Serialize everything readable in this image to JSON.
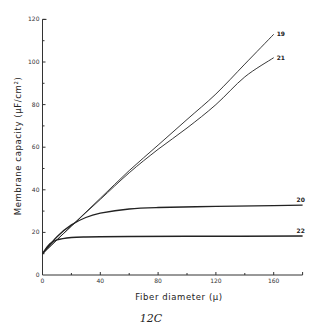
{
  "chart_data": {
    "type": "line",
    "title": "",
    "caption": "12C",
    "xlabel": "Fiber diameter (μ)",
    "ylabel": "Membrane capacity (μF/cm²)",
    "xlim": [
      0,
      180
    ],
    "ylim": [
      0,
      120
    ],
    "x_ticks": [
      0,
      40,
      80,
      120,
      160
    ],
    "x_minor_ticks": [
      20,
      60,
      100,
      140
    ],
    "y_ticks": [
      0,
      20,
      40,
      60,
      80,
      100,
      120
    ],
    "y_minor_ticks": [
      10,
      30,
      50,
      70,
      90,
      110
    ],
    "grid": false,
    "legend": "inline labels at right end of curves",
    "series": [
      {
        "name": "19",
        "x": [
          0,
          20,
          40,
          60,
          80,
          100,
          120,
          140,
          160
        ],
        "values": [
          10,
          23,
          36,
          49,
          61,
          73,
          85,
          99,
          113
        ]
      },
      {
        "name": "21",
        "x": [
          0,
          20,
          40,
          60,
          80,
          100,
          120,
          140,
          160
        ],
        "values": [
          10,
          23,
          35.5,
          48,
          59,
          69,
          80,
          93,
          102
        ]
      },
      {
        "name": "20",
        "x": [
          0,
          10,
          20,
          30,
          40,
          60,
          80,
          120,
          160,
          180
        ],
        "values": [
          10,
          18,
          23.5,
          27,
          29,
          31,
          31.7,
          32.2,
          32.6,
          32.8
        ]
      },
      {
        "name": "22",
        "x": [
          0,
          5,
          10,
          20,
          30,
          40,
          60,
          100,
          180
        ],
        "values": [
          10,
          14.5,
          16.5,
          17.6,
          17.9,
          18,
          18.1,
          18.2,
          18.3
        ]
      }
    ]
  }
}
